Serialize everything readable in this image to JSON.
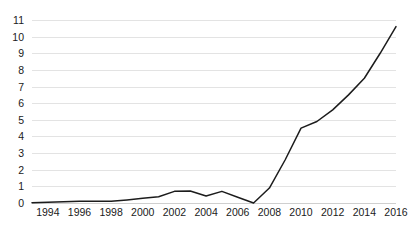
{
  "chart_data": {
    "type": "line",
    "title": "",
    "subtitle": "",
    "xlabel": "",
    "ylabel": "",
    "xlim": [
      1993,
      2016
    ],
    "ylim": [
      0,
      11
    ],
    "grid": true,
    "legend": "none",
    "y_ticks": [
      0,
      1,
      2,
      3,
      4,
      5,
      6,
      7,
      8,
      9,
      10,
      11
    ],
    "y_tick_labels": [
      "0",
      "1",
      "2",
      "3",
      "4",
      "5",
      "6",
      "7",
      "8",
      "9",
      "10",
      "11"
    ],
    "x_ticks": [
      1994,
      1996,
      1998,
      2000,
      2002,
      2004,
      2006,
      2008,
      2010,
      2012,
      2014,
      2016
    ],
    "x_tick_labels": [
      "1994",
      "1996",
      "1998",
      "2000",
      "2002",
      "2004",
      "2006",
      "2008",
      "2010",
      "2012",
      "2014",
      "2016"
    ],
    "series": [
      {
        "name": "series-1",
        "color": "#1c1c1c",
        "x": [
          1993,
          1994,
          1995,
          1996,
          1997,
          1998,
          1999,
          2000,
          2001,
          2002,
          2003,
          2004,
          2005,
          2006,
          2007,
          2008,
          2009,
          2010,
          2011,
          2012,
          2013,
          2014,
          2015,
          2016
        ],
        "values": [
          0.02,
          0.05,
          0.08,
          0.1,
          0.1,
          0.1,
          0.18,
          0.28,
          0.38,
          0.7,
          0.72,
          0.42,
          0.7,
          0.35,
          0.0,
          0.9,
          2.6,
          4.5,
          4.9,
          5.6,
          6.5,
          7.5,
          9.0,
          10.6
        ]
      }
    ]
  },
  "colors": {
    "line": "#1c1c1c",
    "grid": "#e3e3e3",
    "baseline": "#cfcfcf",
    "text": "#1a1a1a",
    "background": "#ffffff"
  }
}
